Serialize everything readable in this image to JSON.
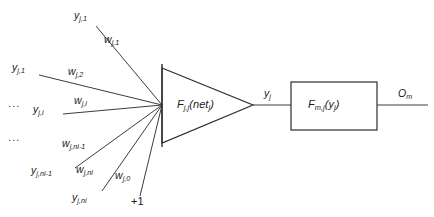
{
  "diagram": {
    "background": "#ffffff",
    "stroke": "#3c3c3c",
    "text_color": "#1a1a1a",
    "nodes": {
      "summation": {
        "shape": "triangle",
        "label_main": "F",
        "label_sub": "j,j",
        "label_tail": "(net",
        "label_tail_sub": "j",
        "label_close": ")"
      },
      "output_block": {
        "shape": "rectangle",
        "label_main": "F",
        "label_sub": "m,j",
        "label_tail": "(y",
        "label_tail_sub": "j",
        "label_close": ")"
      }
    },
    "inputs": [
      {
        "name": "input-1",
        "value": "y",
        "sub": "j,1"
      },
      {
        "name": "input-2",
        "value": "y",
        "sub": "j,1"
      },
      {
        "name": "input-i",
        "value": "y",
        "sub": "j,i"
      },
      {
        "name": "input-ni-1",
        "value": "y",
        "sub": "j,ni-1"
      },
      {
        "name": "input-ni",
        "value": "y",
        "sub": "j,ni"
      }
    ],
    "weights": [
      {
        "name": "weight-1",
        "value": "w",
        "sub": "j,1"
      },
      {
        "name": "weight-2",
        "value": "w",
        "sub": "j,2"
      },
      {
        "name": "weight-i",
        "value": "w",
        "sub": "j,i"
      },
      {
        "name": "weight-ni-1",
        "value": "w",
        "sub": "j,ni-1"
      },
      {
        "name": "weight-ni",
        "value": "w",
        "sub": "j,ni"
      },
      {
        "name": "weight-bias",
        "value": "w",
        "sub": "j,0"
      }
    ],
    "bias": {
      "label": "+1"
    },
    "ellipsis": {
      "glyph": "..."
    },
    "signals": {
      "internal": {
        "value": "y",
        "sub": "j"
      },
      "output": {
        "value": "O",
        "sub": "m"
      }
    }
  }
}
